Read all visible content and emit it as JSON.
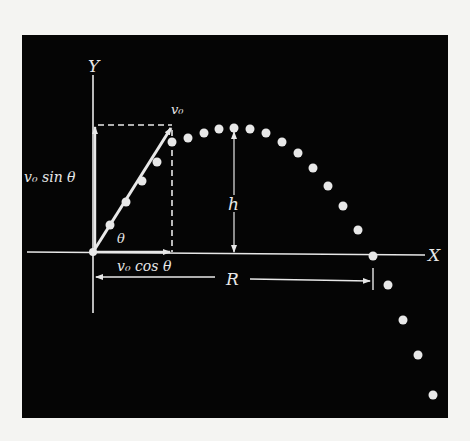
{
  "diagram": {
    "background_color": "#050505",
    "foreground_color": "#e8e8e8",
    "page_color": "#f4f4f2",
    "labels": {
      "y_axis": "Y",
      "x_axis": "X",
      "initial_velocity": "v₀",
      "vertical_component": "v₀ sin θ",
      "horizontal_component": "v₀ cos θ",
      "angle": "θ",
      "max_height": "h",
      "range": "R"
    },
    "origin_px": [
      93,
      252
    ],
    "trajectory_points_px": [
      [
        93,
        252
      ],
      [
        110,
        225
      ],
      [
        126,
        202
      ],
      [
        142,
        181
      ],
      [
        157,
        162
      ],
      [
        172,
        142
      ],
      [
        188,
        138
      ],
      [
        204,
        133
      ],
      [
        219,
        129
      ],
      [
        234,
        128
      ],
      [
        250,
        129
      ],
      [
        266,
        133
      ],
      [
        282,
        142
      ],
      [
        298,
        153
      ],
      [
        313,
        168
      ],
      [
        328,
        186
      ],
      [
        343,
        206
      ],
      [
        358,
        230
      ],
      [
        373,
        256
      ],
      [
        388,
        285
      ],
      [
        403,
        320
      ],
      [
        418,
        355
      ],
      [
        433,
        395
      ]
    ]
  }
}
